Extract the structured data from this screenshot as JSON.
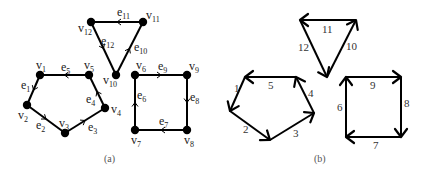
{
  "figure": {
    "panel_a": {
      "caption": "(a)",
      "vertices": [
        {
          "id": "v1",
          "label": "v",
          "sub": "1",
          "x": 40,
          "y": 75,
          "lx": 36,
          "ly": 69
        },
        {
          "id": "v2",
          "label": "v",
          "sub": "2",
          "x": 27,
          "y": 105,
          "lx": 18,
          "ly": 119
        },
        {
          "id": "v3",
          "label": "v",
          "sub": "3",
          "x": 65,
          "y": 133,
          "lx": 59,
          "ly": 127
        },
        {
          "id": "v4",
          "label": "v",
          "sub": "4",
          "x": 105,
          "y": 108,
          "lx": 111,
          "ly": 113
        },
        {
          "id": "v5",
          "label": "v",
          "sub": "5",
          "x": 89,
          "y": 75,
          "lx": 84,
          "ly": 69
        },
        {
          "id": "v6",
          "label": "v",
          "sub": "6",
          "x": 135,
          "y": 75,
          "lx": 136,
          "ly": 69
        },
        {
          "id": "v7",
          "label": "v",
          "sub": "7",
          "x": 135,
          "y": 130,
          "lx": 131,
          "ly": 144
        },
        {
          "id": "v8",
          "label": "v",
          "sub": "8",
          "x": 187,
          "y": 130,
          "lx": 184,
          "ly": 144
        },
        {
          "id": "v9",
          "label": "v",
          "sub": "9",
          "x": 187,
          "y": 75,
          "lx": 189,
          "ly": 70
        },
        {
          "id": "v10",
          "label": "v",
          "sub": "10",
          "x": 116,
          "y": 75,
          "lx": 103,
          "ly": 84
        },
        {
          "id": "v11",
          "label": "v",
          "sub": "11",
          "x": 143,
          "y": 22,
          "lx": 146,
          "ly": 19
        },
        {
          "id": "v12",
          "label": "v",
          "sub": "12",
          "x": 91,
          "y": 22,
          "lx": 78,
          "ly": 32
        }
      ],
      "edges": [
        {
          "id": "e1",
          "label": "e",
          "sub": "1",
          "from": "v1",
          "to": "v2",
          "lx": 21,
          "ly": 89
        },
        {
          "id": "e2",
          "label": "e",
          "sub": "2",
          "from": "v2",
          "to": "v3",
          "lx": 36,
          "ly": 129
        },
        {
          "id": "e3",
          "label": "e",
          "sub": "3",
          "from": "v3",
          "to": "v4",
          "lx": 88,
          "ly": 131
        },
        {
          "id": "e4",
          "label": "e",
          "sub": "4",
          "from": "v4",
          "to": "v5",
          "lx": 86,
          "ly": 103
        },
        {
          "id": "e5",
          "label": "e",
          "sub": "5",
          "from": "v5",
          "to": "v1",
          "lx": 61,
          "ly": 71
        },
        {
          "id": "e6",
          "label": "e",
          "sub": "6",
          "from": "v7",
          "to": "v6",
          "lx": 137,
          "ly": 99
        },
        {
          "id": "e7",
          "label": "e",
          "sub": "7",
          "from": "v8",
          "to": "v7",
          "lx": 159,
          "ly": 125
        },
        {
          "id": "e8",
          "label": "e",
          "sub": "8",
          "from": "v9",
          "to": "v8",
          "lx": 190,
          "ly": 101
        },
        {
          "id": "e9",
          "label": "e",
          "sub": "9",
          "from": "v6",
          "to": "v9",
          "lx": 158,
          "ly": 70
        },
        {
          "id": "e10",
          "label": "e",
          "sub": "10",
          "from": "v10",
          "to": "v11",
          "lx": 134,
          "ly": 51
        },
        {
          "id": "e11",
          "label": "e",
          "sub": "11",
          "from": "v11",
          "to": "v12",
          "lx": 117,
          "ly": 16
        },
        {
          "id": "e12",
          "label": "e",
          "sub": "12",
          "from": "v12",
          "to": "v10",
          "lx": 101,
          "ly": 45
        }
      ]
    },
    "panel_b": {
      "caption": "(b)",
      "edges": [
        {
          "label": "1",
          "x1": 245,
          "y1": 77,
          "x2": 230,
          "y2": 111,
          "lx": 234,
          "ly": 92
        },
        {
          "label": "2",
          "x1": 230,
          "y1": 111,
          "x2": 270,
          "y2": 140,
          "lx": 243,
          "ly": 133
        },
        {
          "label": "3",
          "x1": 270,
          "y1": 140,
          "x2": 314,
          "y2": 113,
          "lx": 293,
          "ly": 137
        },
        {
          "label": "4",
          "x1": 314,
          "y1": 113,
          "x2": 296,
          "y2": 77,
          "lx": 308,
          "ly": 97
        },
        {
          "label": "5",
          "x1": 296,
          "y1": 77,
          "x2": 245,
          "y2": 77,
          "lx": 268,
          "ly": 89
        },
        {
          "label": "6",
          "x1": 346,
          "y1": 137,
          "x2": 346,
          "y2": 77,
          "lx": 337,
          "ly": 111
        },
        {
          "label": "7",
          "x1": 401,
          "y1": 137,
          "x2": 346,
          "y2": 137,
          "lx": 373,
          "ly": 149
        },
        {
          "label": "8",
          "x1": 401,
          "y1": 77,
          "x2": 401,
          "y2": 137,
          "lx": 404,
          "ly": 107
        },
        {
          "label": "9",
          "x1": 346,
          "y1": 77,
          "x2": 401,
          "y2": 77,
          "lx": 370,
          "ly": 89
        },
        {
          "label": "10",
          "x1": 327,
          "y1": 77,
          "x2": 356,
          "y2": 20,
          "lx": 346,
          "ly": 50
        },
        {
          "label": "11",
          "x1": 356,
          "y1": 20,
          "x2": 300,
          "y2": 20,
          "lx": 322,
          "ly": 33
        },
        {
          "label": "12",
          "x1": 300,
          "y1": 20,
          "x2": 327,
          "y2": 77,
          "lx": 298,
          "ly": 51
        }
      ]
    }
  }
}
